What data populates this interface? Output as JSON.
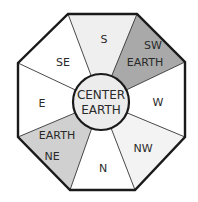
{
  "diagram": {
    "center": {
      "line1": "CENTER",
      "line2": "EARTH",
      "color": "#ececec"
    },
    "sectors": [
      {
        "id": "s",
        "lines": [
          "S"
        ],
        "color": "#efefef"
      },
      {
        "id": "sw",
        "lines": [
          "SW",
          "EARTH"
        ],
        "color": "#a9a9a9"
      },
      {
        "id": "w",
        "lines": [
          "W"
        ],
        "color": "#ffffff"
      },
      {
        "id": "nw",
        "lines": [
          "NW"
        ],
        "color": "#f3f3f3"
      },
      {
        "id": "n",
        "lines": [
          "N"
        ],
        "color": "#ffffff"
      },
      {
        "id": "ne",
        "lines": [
          "EARTH",
          "NE"
        ],
        "color": "#d0d0d0"
      },
      {
        "id": "e",
        "lines": [
          "E"
        ],
        "color": "#ffffff"
      },
      {
        "id": "se",
        "lines": [
          "SE"
        ],
        "color": "#ffffff"
      }
    ],
    "outline_color": "#1a1a1a"
  }
}
